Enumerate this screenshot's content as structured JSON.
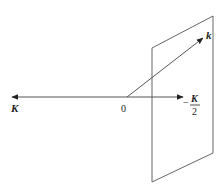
{
  "diagram": {
    "labels": {
      "left_axis": "K",
      "origin": "0",
      "right_axis_sign": "−",
      "right_axis_numerator": "K",
      "right_axis_denominator": "2",
      "oblique_vector": "k"
    },
    "colors": {
      "stroke": "#555555",
      "arrow": "#222222",
      "text": "#222222",
      "background": "#ffffff"
    }
  }
}
